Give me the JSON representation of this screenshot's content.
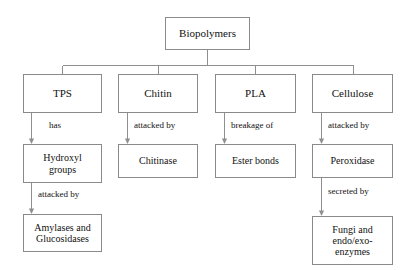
{
  "diagram": {
    "title": "Biopolymers",
    "type": "flowchart",
    "background_color": "#ffffff",
    "line_color": "#8f8f8f",
    "box_border_color": "#8a8a8a",
    "text_color": "#111111",
    "root": {
      "id": "biopolymers",
      "label": "Biopolymers"
    },
    "branches": [
      {
        "id": "tps",
        "label": "TPS",
        "relation_1": "has",
        "child_1": "Hydroxyl\ngroups",
        "relation_2": "attacked by",
        "child_2": "Amylases and\nGlucosidases"
      },
      {
        "id": "chitin",
        "label": "Chitin",
        "relation_1": "attacked by",
        "child_1": "Chitinase",
        "relation_2": "",
        "child_2": ""
      },
      {
        "id": "pla",
        "label": "PLA",
        "relation_1": "breakage of",
        "child_1": "Ester bonds",
        "relation_2": "",
        "child_2": ""
      },
      {
        "id": "cellulose",
        "label": "Cellulose",
        "relation_1": "attacked by",
        "child_1": "Peroxidase",
        "relation_2": "secreted by",
        "child_2": "Fungi and\nendo/exo-\nenzymes"
      }
    ]
  }
}
